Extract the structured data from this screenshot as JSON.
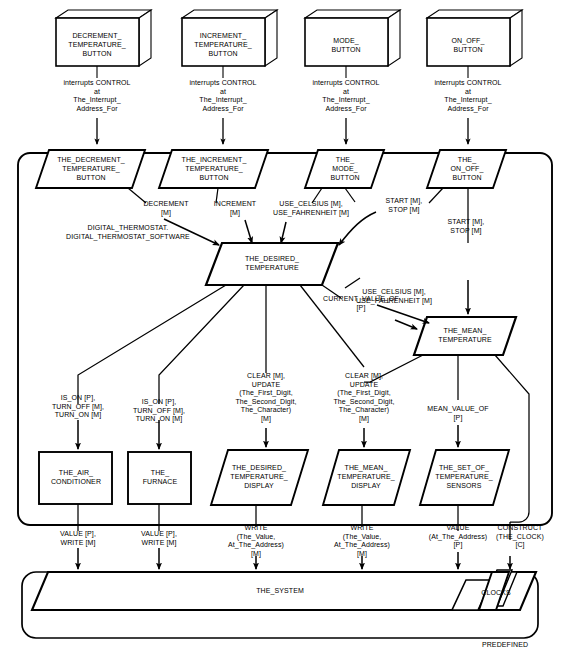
{
  "diagram": {
    "subsystem_label": "DIGITAL_THERMOSTAT.\nDIGITAL_THERMOSTAT_SOFTWARE",
    "predefined_label": "PREDEFINED",
    "style": {
      "stroke": "#000000",
      "fill": "#ffffff",
      "text": "#000000"
    }
  },
  "devices": [
    {
      "id": "decrement_temperature_button",
      "label": "DECREMENT_\nTEMPERATURE_\nBUTTON"
    },
    {
      "id": "increment_temperature_button",
      "label": "INCREMENT_\nTEMPERATURE_\nBUTTON"
    },
    {
      "id": "mode_button",
      "label": "MODE_\nBUTTON"
    },
    {
      "id": "on_off_button",
      "label": "ON_OFF_\nBUTTON"
    }
  ],
  "interrupt_labels": [
    {
      "id": "interrupt_decrement",
      "text": "interrupts CONTROL\nat\nThe_Interrupt_\nAddress_For"
    },
    {
      "id": "interrupt_increment",
      "text": "interrupts CONTROL\nat\nThe_Interrupt_\nAddress_For"
    },
    {
      "id": "interrupt_mode",
      "text": "interrupts CONTROL\nat\nThe_Interrupt_\nAddress_For"
    },
    {
      "id": "interrupt_on_off",
      "text": "interrupts CONTROL\nat\nThe_Interrupt_\nAddress_For"
    }
  ],
  "button_objects": [
    {
      "id": "the_decrement_temperature_button",
      "label": "THE_DECREMENT_\nTEMPERATURE_\nBUTTON"
    },
    {
      "id": "the_increment_temperature_button",
      "label": "THE_INCREMENT_\nTEMPERATURE_\nBUTTON"
    },
    {
      "id": "the_mode_button",
      "label": "THE_\nMODE_\nBUTTON"
    },
    {
      "id": "the_on_off_button",
      "label": "THE_\nON_OFF_\nBUTTON"
    }
  ],
  "core_objects": [
    {
      "id": "the_desired_temperature",
      "label": "THE_DESIRED_\nTEMPERATURE"
    },
    {
      "id": "the_mean_temperature",
      "label": "THE_MEAN_\nTEMPERATURE"
    }
  ],
  "leaf_objects": [
    {
      "id": "the_air_conditioner",
      "label": "THE_AIR_\nCONDITIONER",
      "shape": "rectangle"
    },
    {
      "id": "the_furnace",
      "label": "THE_\nFURNACE",
      "shape": "rectangle"
    },
    {
      "id": "the_desired_temperature_display",
      "label": "THE_DESIRED_\nTEMPERATURE_\nDISPLAY",
      "shape": "parallelogram"
    },
    {
      "id": "the_mean_temperature_display",
      "label": "THE_MEAN_\nTEMPERATURE_\nDISPLAY",
      "shape": "parallelogram"
    },
    {
      "id": "the_set_of_temperature_sensors",
      "label": "THE_SET_OF_\nTEMPERATURE_\nSENSORS",
      "shape": "parallelogram"
    }
  ],
  "system": {
    "id": "the_system",
    "label": "THE_SYSTEM"
  },
  "clocks": {
    "id": "clocks",
    "label": "CLOCKS"
  },
  "flow_labels": [
    {
      "id": "decrement_m",
      "text": "DECREMENT\n[M]"
    },
    {
      "id": "increment_m",
      "text": "INCREMENT\n[M]"
    },
    {
      "id": "use_celsius_fahrenheit_top",
      "text": "USE_CELSIUS [M],\nUSE_FAHRENHEIT [M]"
    },
    {
      "id": "start_stop_mode",
      "text": "START [M],\nSTOP [M]"
    },
    {
      "id": "start_stop_on_off",
      "text": "START [M],\nSTOP [M]"
    },
    {
      "id": "use_celsius_fahrenheit_mean",
      "text": "USE_CELSIUS [M],\nUSE_FAHRENHEIT [M]"
    },
    {
      "id": "current_value_of",
      "text": "CURRENT_VALUE_OF\n[P]"
    },
    {
      "id": "is_on_air_conditioner",
      "text": "IS_ON [P],\nTURN_OFF [M],\nTURN_ON [M]"
    },
    {
      "id": "is_on_furnace",
      "text": "IS_ON [P],\nTURN_OFF [M],\nTURN_ON [M]"
    },
    {
      "id": "clear_update_desired",
      "text": "CLEAR [M],\nUPDATE\n(The_First_Digit,\nThe_Second_Digit,\nThe_Character)\n[M]"
    },
    {
      "id": "clear_update_mean",
      "text": "CLEAR [M],\nUPDATE\n(The_First_Digit,\nThe_Second_Digit,\nThe_Character)\n[M]"
    },
    {
      "id": "mean_value_of",
      "text": "MEAN_VALUE_OF\n[P]"
    },
    {
      "id": "value_write_air_conditioner",
      "text": "VALUE [P],\nWRITE [M]"
    },
    {
      "id": "value_write_furnace",
      "text": "VALUE [P],\nWRITE [M]"
    },
    {
      "id": "write_desired_display",
      "text": "WRITE\n(The_Value,\nAt_The_Address)\n[M]"
    },
    {
      "id": "write_mean_display",
      "text": "WRITE\n(The_Value,\nAt_The_Address)\n[M]"
    },
    {
      "id": "value_sensors",
      "text": "VALUE\n(At_The_Address)\n[P]"
    },
    {
      "id": "construct_the_clock",
      "text": "CONSTRUCT\n(THE_CLOCK)\n[C]"
    }
  ]
}
